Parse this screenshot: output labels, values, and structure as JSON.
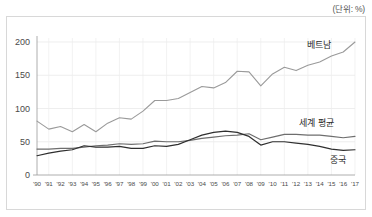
{
  "unit_note": "(단위: %)",
  "chart_data": {
    "type": "line",
    "title": "",
    "subtitle": "",
    "xlabel": "",
    "ylabel": "",
    "unit": "%",
    "grid": true,
    "legend_position": "inline-right",
    "ylim": [
      0,
      215
    ],
    "yticks": [
      0,
      50,
      100,
      150,
      200
    ],
    "ytick_labels": [
      "0",
      "50",
      "100",
      "150",
      "200"
    ],
    "x": [
      1990,
      1991,
      1992,
      1993,
      1994,
      1995,
      1996,
      1997,
      1998,
      1999,
      2000,
      2001,
      2002,
      2003,
      2004,
      2005,
      2006,
      2007,
      2008,
      2009,
      2010,
      2011,
      2012,
      2013,
      2014,
      2015,
      2016,
      2017
    ],
    "xtick_labels": [
      "'90",
      "'91",
      "'92",
      "'93",
      "'94",
      "'95",
      "'96",
      "'97",
      "'98",
      "'99",
      "'00",
      "'01",
      "'02",
      "'03",
      "'04",
      "'05",
      "'06",
      "'07",
      "'08",
      "'09",
      "'10",
      "'11",
      "'12",
      "'13",
      "'14",
      "'15",
      "'16",
      "'17"
    ],
    "series": [
      {
        "name": "베트남",
        "label": "베트남",
        "color": "#9a9a9a",
        "width": 1.1,
        "values": [
          81,
          69,
          73,
          65,
          76,
          65,
          78,
          86,
          84,
          96,
          112,
          112,
          115,
          124,
          133,
          131,
          139,
          156,
          155,
          134,
          152,
          162,
          157,
          165,
          170,
          179,
          185,
          200
        ]
      },
      {
        "name": "세계 평균",
        "label": "세계 평균",
        "color": "#6e6e6e",
        "width": 1.2,
        "values": [
          39,
          39,
          40,
          40,
          42,
          44,
          45,
          47,
          46,
          47,
          51,
          50,
          50,
          52,
          55,
          57,
          59,
          60,
          62,
          53,
          57,
          61,
          61,
          60,
          60,
          58,
          56,
          58
        ]
      },
      {
        "name": "중국",
        "label": "중국",
        "color": "#2f2f2f",
        "width": 1.2,
        "values": [
          29,
          33,
          36,
          38,
          44,
          42,
          42,
          43,
          40,
          40,
          44,
          43,
          46,
          53,
          60,
          64,
          66,
          64,
          58,
          45,
          50,
          50,
          48,
          46,
          43,
          39,
          37,
          38
        ]
      }
    ]
  }
}
